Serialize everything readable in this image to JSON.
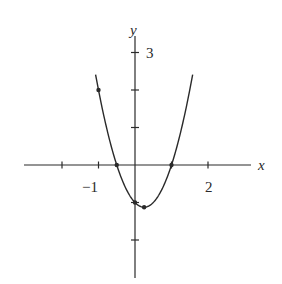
{
  "chart_data": {
    "type": "line",
    "title": "",
    "xlabel": "x",
    "ylabel": "y",
    "function": "y = 2x^2 - x - 1",
    "xlim": [
      -2.5,
      3.2
    ],
    "ylim": [
      -3.0,
      3.4
    ],
    "grid": false,
    "legend": null,
    "x_ticks": [
      -2,
      -1,
      1,
      2
    ],
    "y_ticks": [
      -2,
      -1,
      1,
      2,
      3
    ],
    "x_tick_labels": [
      {
        "value": -1,
        "text": "−1"
      },
      {
        "value": 2,
        "text": "2"
      }
    ],
    "y_tick_labels": [
      {
        "value": 3,
        "text": "3"
      }
    ],
    "curve_domain": [
      -1.08,
      1.58
    ],
    "series": [
      {
        "name": "parabola",
        "x": [
          -1.08,
          -1.0,
          -0.75,
          -0.5,
          -0.25,
          0.0,
          0.25,
          0.5,
          0.75,
          1.0,
          1.25,
          1.5,
          1.58
        ],
        "y": [
          2.41,
          2.0,
          0.875,
          0.0,
          -0.625,
          -1.0,
          -1.125,
          -1.0,
          -0.625,
          0.0,
          0.875,
          2.0,
          2.41
        ]
      }
    ],
    "marked_points": [
      {
        "x": -1.0,
        "y": 2.0
      },
      {
        "x": -0.5,
        "y": 0.0
      },
      {
        "x": 0.0,
        "y": -1.0
      },
      {
        "x": 0.25,
        "y": -1.125
      },
      {
        "x": 1.0,
        "y": 0.0
      }
    ]
  },
  "labels": {
    "x_axis": "x",
    "y_axis": "y",
    "x_tick_minus1": "−1",
    "x_tick_2": "2",
    "y_tick_3": "3"
  },
  "colors": {
    "ink": "#2a2a2a",
    "background": "#ffffff"
  }
}
